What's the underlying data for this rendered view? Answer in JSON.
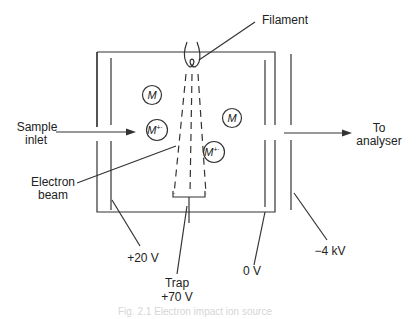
{
  "diagram": {
    "title": "Electron impact ion source",
    "labels": {
      "filament": "Filament",
      "sample_inlet_line1": "Sample",
      "sample_inlet_line2": "inlet",
      "electron_beam_line1": "Electron",
      "electron_beam_line2": "beam",
      "to_analyser_line1": "To",
      "to_analyser_line2": "analyser",
      "repeller_voltage": "+20 V",
      "trap_line1": "Trap",
      "trap_line2": "+70 V",
      "accelerator_voltage": "0 V",
      "focus_voltage": "−4 kV"
    },
    "molecules": [
      {
        "symbol": "M",
        "charge": ""
      },
      {
        "symbol": "M",
        "charge": "+·"
      },
      {
        "symbol": "M",
        "charge": ""
      },
      {
        "symbol": "M",
        "charge": "+·"
      }
    ],
    "caption": "Fig. 2.1  Electron impact ion source"
  }
}
